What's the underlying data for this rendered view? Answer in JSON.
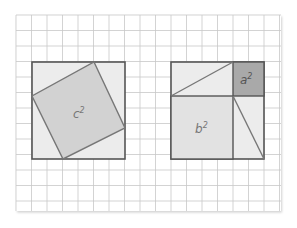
{
  "figure": {
    "grid": {
      "x0": 16,
      "y0": 15,
      "x1": 281,
      "y1": 211,
      "cell": 15.5
    },
    "colors": {
      "grid_line": "#c8c8c8",
      "frame": "#555555",
      "light_fill": "#ececec",
      "c_square_fill": "#d2d2d2",
      "a_square_fill": "#a9a9a9",
      "label": "#777777"
    },
    "left_square": {
      "label_base": "c",
      "label_exp": "2"
    },
    "right_square": {
      "a_label_base": "a",
      "a_label_exp": "2",
      "b_label_base": "b",
      "b_label_exp": "2"
    }
  }
}
